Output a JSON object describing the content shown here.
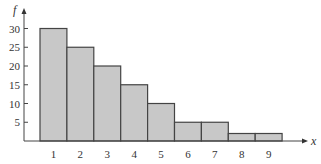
{
  "chart_data": {
    "type": "bar",
    "title": "",
    "xlabel": "x",
    "ylabel": "f",
    "categories": [
      "1",
      "2",
      "3",
      "4",
      "5",
      "6",
      "7",
      "8",
      "9"
    ],
    "values": [
      30,
      25,
      20,
      15,
      10,
      5,
      5,
      2,
      2
    ],
    "ylim": [
      0,
      32
    ],
    "yticks": [
      5,
      10,
      15,
      20,
      25,
      30
    ],
    "grid": false,
    "legend": null,
    "bar_color": "#c8c8c8",
    "edge_color": "#444444"
  }
}
